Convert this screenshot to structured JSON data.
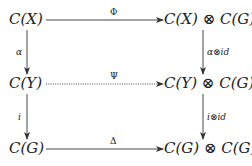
{
  "diagram": {
    "type": "commutative-diagram",
    "nodes": {
      "top_left": "C(X)",
      "top_right": "C(X) ⊗ C(G)",
      "mid_left": "C(Y)",
      "mid_right": "C(Y) ⊗ C(G)",
      "bot_left": "C(G)",
      "bot_right": "C(G) ⊗ C(G)"
    },
    "arrows": {
      "top": {
        "label": "Φ",
        "from": "C(X)",
        "to": "C(X) ⊗ C(G)",
        "style": "solid"
      },
      "mid": {
        "label": "Ψ",
        "from": "C(Y)",
        "to": "C(Y) ⊗ C(G)",
        "style": "dotted"
      },
      "bot": {
        "label": "Δ",
        "from": "C(G)",
        "to": "C(G) ⊗ C(G)",
        "style": "solid"
      },
      "left_upper": {
        "label": "α",
        "from": "C(X)",
        "to": "C(Y)",
        "style": "solid"
      },
      "left_lower": {
        "label": "i",
        "from": "C(Y)",
        "to": "C(G)",
        "style": "solid"
      },
      "right_upper": {
        "label": "α⊗id",
        "from": "C(X) ⊗ C(G)",
        "to": "C(Y) ⊗ C(G)",
        "style": "solid"
      },
      "right_lower": {
        "label": "i⊗id",
        "from": "C(Y) ⊗ C(G)",
        "to": "C(G) ⊗ C(G)",
        "style": "solid"
      }
    }
  }
}
